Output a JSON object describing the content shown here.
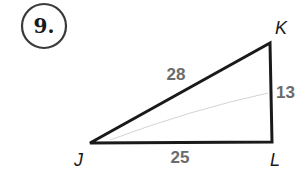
{
  "problem": {
    "number": "9."
  },
  "triangle": {
    "vertices": [
      {
        "name": "J",
        "x": 90,
        "y": 143
      },
      {
        "name": "K",
        "x": 270,
        "y": 43
      },
      {
        "name": "L",
        "x": 272,
        "y": 142
      }
    ],
    "sides": {
      "JK": "28",
      "KL": "13",
      "JL": "25"
    },
    "labels": {
      "J": "J",
      "K": "K",
      "L": "L"
    },
    "stroke_color": "#1a1a1a",
    "side_label_color": "#6b6b6b"
  }
}
